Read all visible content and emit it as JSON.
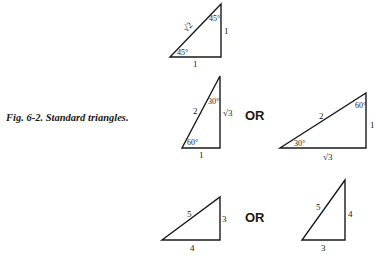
{
  "figure": {
    "caption": "Fig. 6-2. Standard triangles.",
    "or_label": "OR",
    "stroke_color": "#1a1a1a",
    "background": "#ffffff"
  },
  "triangles": [
    {
      "id": "t45",
      "type": "45-45-90",
      "vertices": [
        [
          170,
          57
        ],
        [
          221,
          57
        ],
        [
          221,
          4
        ]
      ],
      "labels": {
        "hypotenuse": "√2",
        "vertical": "1",
        "horizontal": "1",
        "angle_bottom": "45°",
        "angle_top": "45°"
      }
    },
    {
      "id": "t3060_tall",
      "type": "30-60-90",
      "vertices": [
        [
          182,
          148
        ],
        [
          220,
          148
        ],
        [
          220,
          76
        ]
      ],
      "labels": {
        "hypotenuse": "2",
        "vertical": "√3",
        "horizontal": "1",
        "angle_bottom": "60°",
        "angle_top": "30°"
      }
    },
    {
      "id": "t3060_wide",
      "type": "30-60-90",
      "vertices": [
        [
          280,
          148
        ],
        [
          366,
          148
        ],
        [
          366,
          93
        ]
      ],
      "labels": {
        "hypotenuse": "2",
        "vertical": "1",
        "horizontal": "√3",
        "angle_bottom": "30°",
        "angle_top": "60°"
      }
    },
    {
      "id": "t345_wide",
      "type": "3-4-5",
      "vertices": [
        [
          162,
          240
        ],
        [
          220,
          240
        ],
        [
          220,
          197
        ]
      ],
      "labels": {
        "hypotenuse": "5",
        "vertical": "3",
        "horizontal": "4"
      }
    },
    {
      "id": "t345_tall",
      "type": "3-4-5",
      "vertices": [
        [
          302,
          240
        ],
        [
          345,
          240
        ],
        [
          345,
          180
        ]
      ],
      "labels": {
        "hypotenuse": "5",
        "vertical": "4",
        "horizontal": "3"
      }
    }
  ]
}
